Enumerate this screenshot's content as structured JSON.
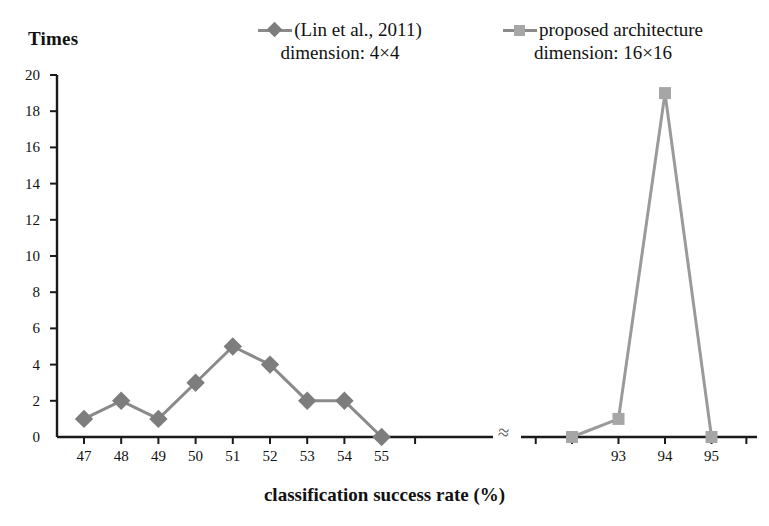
{
  "chart_data": {
    "type": "line",
    "title": "",
    "ylabel": "Times",
    "xlabel": "classification success rate (%)",
    "ylim": [
      0,
      20
    ],
    "ytick_values": [
      0,
      2,
      4,
      6,
      8,
      10,
      12,
      14,
      16,
      18,
      20
    ],
    "ytick_labels": [
      "0",
      "2",
      "4",
      "6",
      "8",
      "10",
      "12",
      "14",
      "16",
      "18",
      "20"
    ],
    "grid": false,
    "legend_position": "top-center",
    "axis_break": {
      "symbol": "≈",
      "between": [
        55,
        92
      ],
      "note": "broken x-axis between the two clusters"
    },
    "xtick_labels_left": [
      "47",
      "48",
      "49",
      "50",
      "51",
      "52",
      "53",
      "54",
      "55"
    ],
    "xtick_labels_right": [
      "93",
      "94",
      "95"
    ],
    "series": [
      {
        "name": "(Lin et al., 2011)",
        "sublabel": "dimension: 4×4",
        "marker": "diamond",
        "color": "#7d7d7d",
        "line_color": "#8a8a8a",
        "x": [
          47,
          48,
          49,
          50,
          51,
          52,
          53,
          54,
          55
        ],
        "values": [
          1,
          2,
          1,
          3,
          5,
          4,
          2,
          2,
          0
        ]
      },
      {
        "name": "proposed architecture",
        "sublabel": "dimension: 16×16",
        "marker": "square",
        "color": "#a6a6a6",
        "line_color": "#9a9a9a",
        "x": [
          92,
          93,
          94,
          95
        ],
        "values": [
          0,
          1,
          19,
          0
        ]
      }
    ]
  },
  "legend": {
    "entries": [
      {
        "label": "(Lin et al., 2011)",
        "sublabel": "dimension: 4×4",
        "marker": "diamond-marker"
      },
      {
        "label": "proposed architecture",
        "sublabel": "dimension: 16×16",
        "marker": "square-marker"
      }
    ]
  },
  "axes": {
    "y_title": "Times",
    "x_title": "classification success rate (%)",
    "break_symbol": "≈"
  },
  "colors": {
    "series1": "#7d7d7d",
    "series2": "#a6a6a6",
    "axis": "#1a1a1a",
    "text": "#111111",
    "background": "#ffffff"
  }
}
